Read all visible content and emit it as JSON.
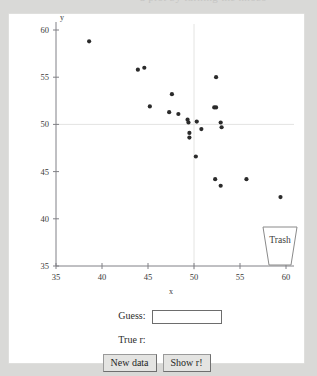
{
  "page": {
    "cutoff_heading": "a plot by turning the knobs",
    "background_color": "#d9d9d7",
    "panel_color": "#ffffff"
  },
  "chart_data": {
    "type": "scatter",
    "title": "",
    "xlabel": "x",
    "ylabel": "y",
    "xlim": [
      35,
      60
    ],
    "ylim": [
      35,
      60
    ],
    "xticks": [
      35,
      40,
      45,
      50,
      55,
      60
    ],
    "yticks": [
      35,
      40,
      45,
      50,
      55,
      60
    ],
    "xticklabels": [
      "35",
      "40",
      "45",
      "50",
      "55",
      "60"
    ],
    "yticklabels": [
      "35",
      "40",
      "45",
      "50",
      "55",
      "60"
    ],
    "grid": true,
    "gridlines_x": [
      50
    ],
    "gridlines_y": [
      50
    ],
    "legend": "none",
    "marker_color": "#2b2b2b",
    "points": [
      {
        "x": 38.6,
        "y": 58.8
      },
      {
        "x": 43.9,
        "y": 55.8
      },
      {
        "x": 44.6,
        "y": 56.0
      },
      {
        "x": 45.2,
        "y": 51.9
      },
      {
        "x": 47.6,
        "y": 53.2
      },
      {
        "x": 47.3,
        "y": 51.3
      },
      {
        "x": 48.3,
        "y": 51.1
      },
      {
        "x": 49.3,
        "y": 50.5
      },
      {
        "x": 49.4,
        "y": 50.2
      },
      {
        "x": 49.5,
        "y": 49.1
      },
      {
        "x": 49.5,
        "y": 48.6
      },
      {
        "x": 50.3,
        "y": 50.3
      },
      {
        "x": 50.8,
        "y": 49.5
      },
      {
        "x": 50.2,
        "y": 46.6
      },
      {
        "x": 52.4,
        "y": 55.0
      },
      {
        "x": 52.2,
        "y": 51.8
      },
      {
        "x": 52.4,
        "y": 51.8
      },
      {
        "x": 52.9,
        "y": 50.2
      },
      {
        "x": 53.0,
        "y": 49.7
      },
      {
        "x": 52.3,
        "y": 44.2
      },
      {
        "x": 52.9,
        "y": 43.5
      },
      {
        "x": 55.7,
        "y": 44.2
      },
      {
        "x": 59.4,
        "y": 42.3
      },
      {
        "x": 59.3,
        "y": 38.4
      }
    ]
  },
  "trash": {
    "label": "Trash"
  },
  "form": {
    "guess_label": "Guess:",
    "guess_value": "",
    "guess_placeholder": "",
    "true_r_label": "True r:",
    "true_r_value": "",
    "new_data_button": "New data",
    "show_r_button": "Show r!"
  }
}
